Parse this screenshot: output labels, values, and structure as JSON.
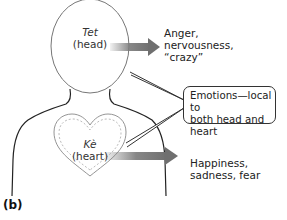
{
  "figure": {
    "panel_label": "(b)",
    "head": {
      "term": "Tet",
      "gloss": "(head)"
    },
    "heart": {
      "term": "Kè",
      "gloss": "(heart)"
    },
    "head_emotions": [
      "Anger,",
      "nervousness,",
      "“crazy”"
    ],
    "heart_emotions": [
      "Happiness,",
      "sadness, fear"
    ],
    "callout": [
      "Emotions—local to",
      "both head and heart"
    ],
    "colors": {
      "arrow": "#7a7a7a",
      "outline": "#333333",
      "dashed": "#aaaaaa"
    }
  }
}
